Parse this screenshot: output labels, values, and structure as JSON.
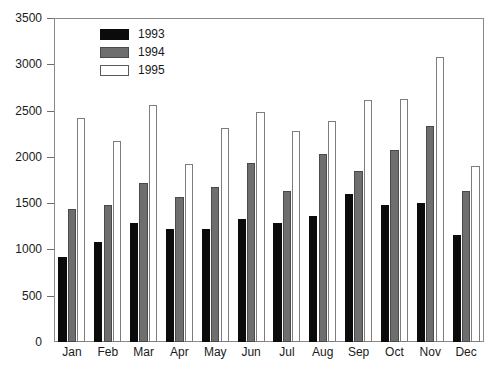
{
  "chart_data": {
    "type": "bar",
    "title": "",
    "subtitle": "",
    "xlabel": "",
    "ylabel": "",
    "categories": [
      "Jan",
      "Feb",
      "Mar",
      "Apr",
      "May",
      "Jun",
      "Jul",
      "Aug",
      "Sep",
      "Oct",
      "Nov",
      "Dec"
    ],
    "series": [
      {
        "name": "1993",
        "color": "#0b0b0b",
        "values": [
          920,
          1080,
          1290,
          1220,
          1225,
          1325,
          1285,
          1365,
          1600,
          1475,
          1505,
          1155
        ]
      },
      {
        "name": "1994",
        "color": "#6e6e6e",
        "values": [
          1440,
          1480,
          1715,
          1565,
          1675,
          1930,
          1635,
          2030,
          1850,
          2070,
          2330,
          1635
        ]
      },
      {
        "name": "1995",
        "color": "#ffffff",
        "values": [
          2420,
          2170,
          2560,
          1925,
          2315,
          2485,
          2275,
          2385,
          2610,
          2620,
          3075,
          1905
        ]
      }
    ],
    "ylim": [
      0,
      3500
    ],
    "yticks": [
      0,
      500,
      1000,
      1500,
      2000,
      2500,
      3000,
      3500
    ],
    "ytick_labels": [
      "0",
      "500",
      "1000",
      "1500",
      "2000",
      "2500",
      "3000",
      "3500"
    ],
    "grid": false,
    "legend_position": "top-left",
    "legend_entries": [
      "1993",
      "1994",
      "1995"
    ]
  },
  "axes": {
    "frame_color": "#8a8a8a",
    "tick_color": "#6f6f6f",
    "text_color": "#1a1a1a"
  }
}
